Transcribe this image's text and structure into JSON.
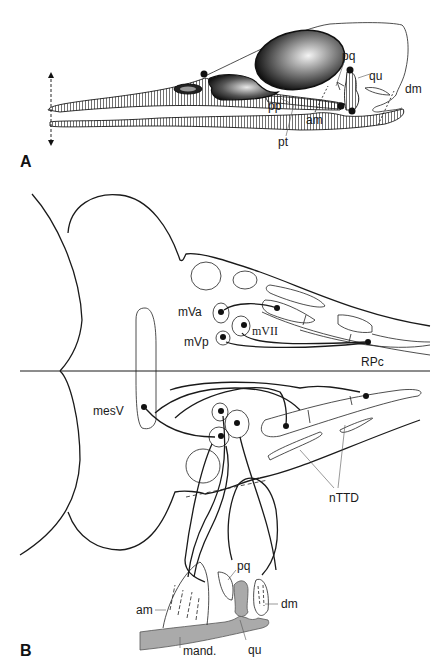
{
  "figure": {
    "panels": [
      {
        "id": "A",
        "label": "A",
        "description": "Lateral view of bird skull (duck-like bill) with jaw muscles and kinetic joints",
        "annotations": {
          "pq": "pq",
          "qu": "qu",
          "dm": "dm",
          "pp": "pp",
          "am": "am",
          "pt": "pt"
        }
      },
      {
        "id": "B",
        "label": "B",
        "description": "Brainstem schematic showing trigeminal and facial motor nuclei projections to jaw muscles",
        "annotations": {
          "mVa": "mVa",
          "mVp": "mVp",
          "mVII": "mVII",
          "RPc": "RPc",
          "mesV": "mesV",
          "nTTD": "nTTD",
          "pq": "pq",
          "am": "am",
          "dm": "dm",
          "qu": "qu",
          "mand": "mand."
        }
      }
    ],
    "colors": {
      "line": "#1a1a1a",
      "bone_fill": "#aaaaaa",
      "background": "#ffffff"
    }
  }
}
